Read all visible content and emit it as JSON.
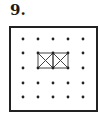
{
  "problem": {
    "number_label": "9."
  },
  "diagram": {
    "type": "dot-grid",
    "grid_rows": 5,
    "grid_cols": 5,
    "frame": {
      "x": 10,
      "y": 27,
      "width": 87,
      "height": 84,
      "stroke": "#222222"
    },
    "dot_x": [
      23,
      38,
      53,
      68,
      83
    ],
    "dot_y": [
      39,
      53,
      68,
      83,
      97
    ],
    "dot_color": "#222222",
    "figure": {
      "description": "Two adjacent squares each with both diagonals drawn",
      "cells": [
        {
          "col_start": 1,
          "row_start": 1
        },
        {
          "col_start": 2,
          "row_start": 1
        }
      ],
      "stroke": "#444444"
    }
  }
}
